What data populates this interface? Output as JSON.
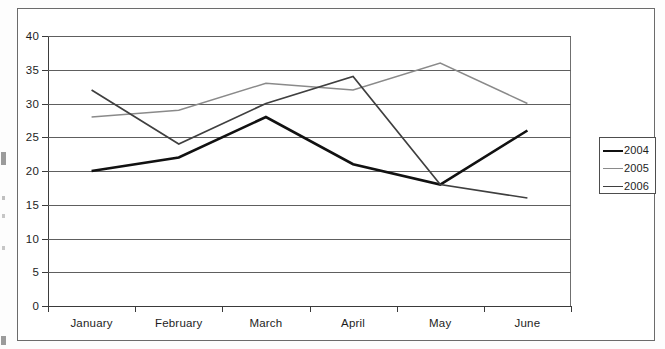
{
  "chart_data": {
    "type": "line",
    "title": "",
    "xlabel": "",
    "ylabel": "",
    "categories": [
      "January",
      "February",
      "March",
      "April",
      "May",
      "June"
    ],
    "ylim": [
      0,
      40
    ],
    "yticks": [
      0,
      5,
      10,
      15,
      20,
      25,
      30,
      35,
      40
    ],
    "grid": true,
    "legend_position": "right",
    "series": [
      {
        "name": "2004",
        "color": "#111111",
        "width": 2.6,
        "dash": "none",
        "values": [
          20,
          22,
          28,
          21,
          18,
          26
        ]
      },
      {
        "name": "2005",
        "color": "#8a8a8a",
        "width": 1.5,
        "dash": "none",
        "values": [
          28,
          29,
          33,
          32,
          36,
          30
        ]
      },
      {
        "name": "2006",
        "color": "#3f3f3f",
        "width": 1.7,
        "dash": "none",
        "values": [
          32,
          24,
          30,
          34,
          18,
          16
        ]
      }
    ]
  },
  "axis": {
    "y_tick_labels": [
      "40",
      "35",
      "30",
      "25",
      "20",
      "15",
      "10",
      "5",
      "0"
    ],
    "x_tick_labels": [
      "January",
      "February",
      "March",
      "April",
      "May",
      "June"
    ]
  },
  "legend": {
    "items": [
      {
        "label": "2004"
      },
      {
        "label": "2005"
      },
      {
        "label": "2006"
      }
    ]
  }
}
